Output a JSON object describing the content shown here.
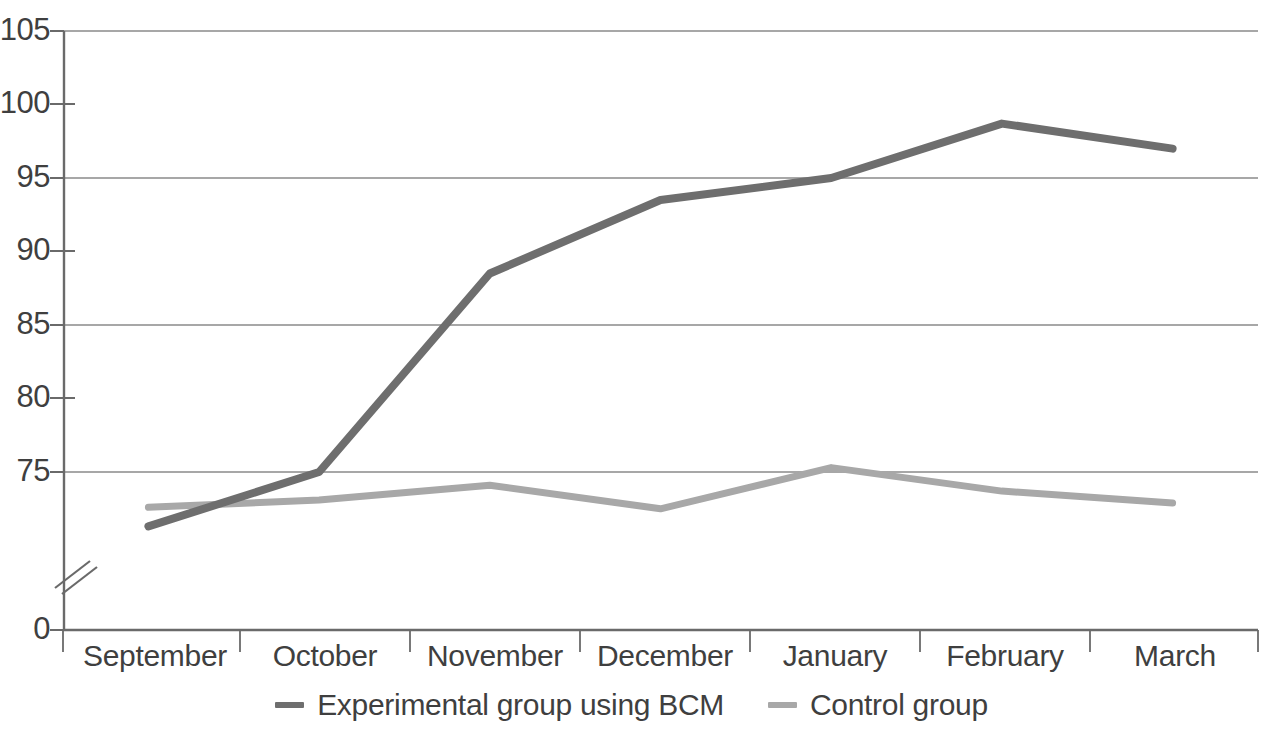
{
  "chart_data": {
    "type": "line",
    "title": "",
    "xlabel": "",
    "ylabel": "",
    "categories": [
      "September",
      "October",
      "November",
      "December",
      "January",
      "February",
      "March"
    ],
    "series": [
      {
        "name": "Experimental group using BCM",
        "color": "#6e6e6e",
        "values": [
          71.3,
          75.0,
          88.5,
          93.5,
          95.0,
          98.7,
          97.0
        ]
      },
      {
        "name": "Control group",
        "color": "#a8a8a8",
        "values": [
          72.6,
          73.1,
          74.1,
          72.5,
          75.3,
          73.7,
          72.9
        ]
      }
    ],
    "y_tick_labels": [
      "0",
      "75",
      "80",
      "85",
      "90",
      "95",
      "100",
      "105"
    ],
    "y_tick_values": [
      0,
      75,
      80,
      85,
      90,
      95,
      100,
      105
    ],
    "y_gridline_values": [
      105,
      95,
      85,
      75,
      0
    ],
    "y_minor_tick_values": [
      100,
      90,
      80
    ],
    "ylim": [
      0,
      105
    ],
    "axis_break": true,
    "axis_break_note": "//",
    "grid": true,
    "legend_position": "bottom"
  },
  "legend": {
    "entries": [
      {
        "label": "Experimental group using BCM",
        "color": "#6e6e6e"
      },
      {
        "label": "Control group",
        "color": "#a8a8a8"
      }
    ]
  },
  "axes": {
    "y_labels": [
      {
        "text": "105",
        "y": 31
      },
      {
        "text": "100",
        "y": 104
      },
      {
        "text": "95",
        "y": 178
      },
      {
        "text": "90",
        "y": 251
      },
      {
        "text": "85",
        "y": 325
      },
      {
        "text": "80",
        "y": 398
      },
      {
        "text": "75",
        "y": 472
      },
      {
        "text": "0",
        "y": 630
      }
    ],
    "x_labels": [
      {
        "text": "September",
        "x": 155
      },
      {
        "text": "October",
        "x": 325
      },
      {
        "text": "November",
        "x": 495
      },
      {
        "text": "December",
        "x": 665
      },
      {
        "text": "January",
        "x": 835
      },
      {
        "text": "February",
        "x": 1005
      },
      {
        "text": "March",
        "x": 1175
      }
    ]
  },
  "colors": {
    "grid": "#8a8a8a",
    "axis": "#6a6a6a",
    "text": "#3f3f3f",
    "background": "#ffffff",
    "series_experimental": "#6e6e6e",
    "series_control": "#a8a8a8"
  }
}
